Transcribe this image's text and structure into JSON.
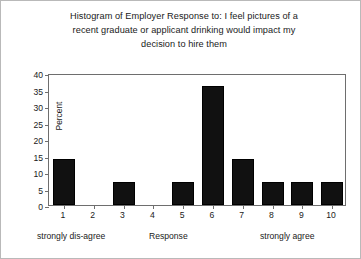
{
  "chart_data": {
    "type": "bar",
    "title": "Histogram of Employer Response to: I feel pictures of a recent graduate or applicant drinking would impact my decision to hire them",
    "title_lines": [
      "Histogram of Employer Response to: I feel pictures of a",
      "recent graduate or applicant drinking would impact my",
      "decision to hire them"
    ],
    "xlabel": "Response",
    "ylabel": "Percent",
    "categories": [
      "1",
      "2",
      "3",
      "4",
      "5",
      "6",
      "7",
      "8",
      "9",
      "10"
    ],
    "values": [
      14,
      0,
      7,
      0,
      7,
      36,
      14,
      7,
      7,
      7
    ],
    "ylim": [
      0,
      40
    ],
    "ytick_labels": [
      "0",
      "5",
      "10",
      "15",
      "20",
      "25",
      "30",
      "35",
      "40"
    ],
    "ytick_values": [
      0,
      5,
      10,
      15,
      20,
      25,
      30,
      35,
      40
    ],
    "grid": false,
    "legend": "none",
    "scale_anchor_low": "strongly dis-agree",
    "scale_anchor_high": "strongly agree",
    "bar_color": "#111111",
    "frame_color": "#6e6e6e",
    "background_color": "#ffffff"
  }
}
